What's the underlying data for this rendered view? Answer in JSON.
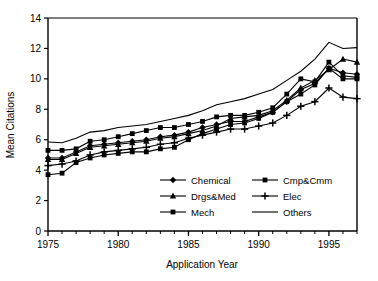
{
  "chart_data": {
    "type": "line",
    "title": "",
    "xlabel": "Application Year",
    "ylabel": "Mean Citations",
    "xlim": [
      1975,
      1997
    ],
    "ylim": [
      0,
      14
    ],
    "xticks": [
      1975,
      1980,
      1985,
      1990,
      1995
    ],
    "yticks": [
      0,
      2,
      4,
      6,
      8,
      10,
      12,
      14
    ],
    "grid": false,
    "legend_position": "inside-bottom-center",
    "x": [
      1975,
      1976,
      1977,
      1978,
      1979,
      1980,
      1981,
      1982,
      1983,
      1984,
      1985,
      1986,
      1987,
      1988,
      1989,
      1990,
      1991,
      1992,
      1993,
      1994,
      1995,
      1996,
      1997
    ],
    "series": [
      {
        "name": "Chemical",
        "marker": "diamond",
        "values": [
          4.8,
          4.8,
          5.2,
          5.6,
          5.7,
          5.8,
          5.9,
          6.0,
          6.2,
          6.3,
          6.5,
          6.8,
          7.0,
          7.2,
          7.2,
          7.5,
          7.8,
          8.5,
          9.3,
          9.7,
          10.7,
          10.4,
          10.3
        ]
      },
      {
        "name": "Cmp&Cmm",
        "marker": "square",
        "values": [
          5.3,
          5.3,
          5.4,
          5.9,
          6.0,
          6.2,
          6.4,
          6.6,
          6.8,
          6.8,
          7.0,
          7.2,
          7.5,
          7.6,
          7.6,
          7.8,
          8.1,
          9.0,
          10.0,
          9.8,
          11.1,
          10.2,
          10.1
        ]
      },
      {
        "name": "Drgs&Med",
        "marker": "triangle",
        "values": [
          4.7,
          4.7,
          5.1,
          5.5,
          5.6,
          5.7,
          5.8,
          5.9,
          6.1,
          6.2,
          6.4,
          6.6,
          6.9,
          7.4,
          7.5,
          7.6,
          7.9,
          8.6,
          9.4,
          9.9,
          10.6,
          11.3,
          11.1
        ]
      },
      {
        "name": "Elec",
        "marker": "plus",
        "values": [
          4.3,
          4.4,
          4.6,
          5.0,
          5.2,
          5.3,
          5.4,
          5.5,
          5.7,
          5.8,
          6.1,
          6.3,
          6.5,
          6.7,
          6.7,
          6.9,
          7.1,
          7.6,
          8.2,
          8.5,
          9.4,
          8.8,
          8.7
        ]
      },
      {
        "name": "Mech",
        "marker": "square",
        "values": [
          3.7,
          3.8,
          4.5,
          4.8,
          5.0,
          5.1,
          5.2,
          5.2,
          5.4,
          5.5,
          6.0,
          6.4,
          6.7,
          7.0,
          7.1,
          7.4,
          7.8,
          8.5,
          9.0,
          9.6,
          10.7,
          10.0,
          10.0
        ]
      },
      {
        "name": "Others",
        "marker": "none",
        "values": [
          5.85,
          5.8,
          6.1,
          6.5,
          6.6,
          6.8,
          6.9,
          7.0,
          7.2,
          7.4,
          7.6,
          7.9,
          8.3,
          8.5,
          8.7,
          9.0,
          9.3,
          9.9,
          10.5,
          11.3,
          12.4,
          12.0,
          12.05
        ]
      }
    ]
  },
  "axis": {
    "ylabel": "Mean Citations",
    "xlabel": "Application Year",
    "yticks": [
      "14",
      "12",
      "10",
      "8",
      "6",
      "4",
      "2",
      "0"
    ],
    "xticks": [
      "1975",
      "1980",
      "1985",
      "1990",
      "1995"
    ]
  },
  "legend": {
    "items": [
      {
        "label": "Chemical",
        "marker": "diamond"
      },
      {
        "label": "Cmp&Cmm",
        "marker": "square"
      },
      {
        "label": "Drgs&Med",
        "marker": "triangle"
      },
      {
        "label": "Elec",
        "marker": "plus"
      },
      {
        "label": "Mech",
        "marker": "square"
      },
      {
        "label": "Others",
        "marker": "none"
      }
    ]
  },
  "colors": {
    "line": "#000000",
    "background": "#ffffff",
    "axis": "#000000"
  }
}
